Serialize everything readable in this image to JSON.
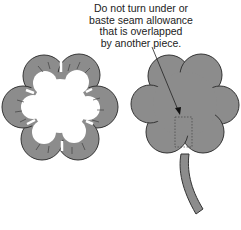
{
  "annotation": {
    "lines": [
      "Do not turn under or",
      "baste seam allowance",
      "that is overlapped",
      "by another piece."
    ]
  },
  "figures": {
    "left": "flower-ring-with-clipped-seam-allowance",
    "right": "flower-appliqué-with-stem"
  },
  "colors": {
    "fill": "#8c8c8c",
    "outline": "#333333",
    "background": "#ffffff",
    "text": "#222222"
  }
}
